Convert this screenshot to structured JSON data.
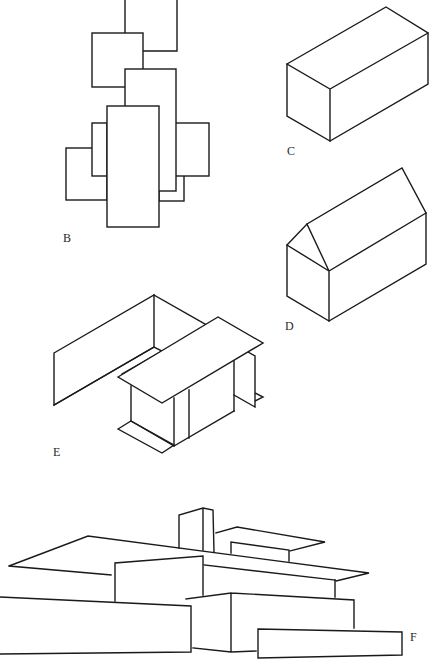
{
  "figure": {
    "stroke_color": "#1a1a1a",
    "background_color": "#ffffff",
    "panels": [
      {
        "id": "B",
        "label": "B",
        "subject": "overlapping rectangles (plan composition)"
      },
      {
        "id": "C",
        "label": "C",
        "subject": "isometric rectangular box"
      },
      {
        "id": "D",
        "label": "D",
        "subject": "isometric gabled house"
      },
      {
        "id": "E",
        "label": "E",
        "subject": "isometric wall planes with roof slab"
      },
      {
        "id": "F",
        "label": "F",
        "subject": "perspective of layered horizontal building masses with chimney"
      }
    ]
  }
}
